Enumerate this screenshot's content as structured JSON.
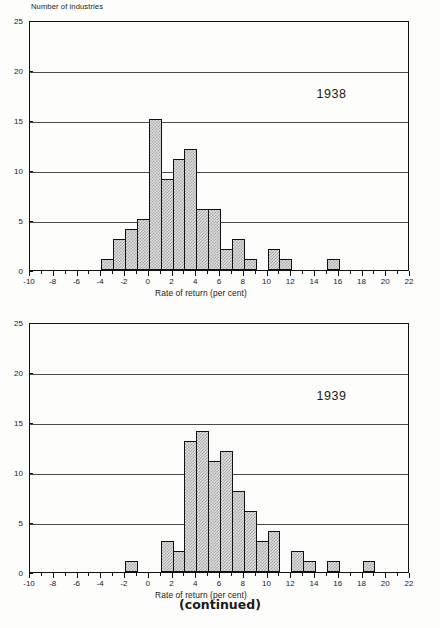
{
  "page": {
    "footer_note": "(continued)"
  },
  "chart_data": [
    {
      "id": "chart-1938",
      "type": "bar",
      "title": "1938",
      "subtitle": "",
      "xlabel": "Rate of return (per cent)",
      "ylabel": "Number of industries",
      "xlim": [
        -10,
        22
      ],
      "ylim": [
        0,
        25
      ],
      "grid": "horizontal",
      "legend": "none",
      "annotation": "1938",
      "x_major_ticks": [
        -10,
        -8,
        -6,
        -4,
        -2,
        0,
        2,
        4,
        6,
        8,
        10,
        12,
        14,
        16,
        18,
        20,
        22
      ],
      "x_minor_ticks": [
        -9,
        -7,
        -5,
        -3,
        -1,
        1,
        3,
        5,
        7,
        9,
        11,
        13,
        15,
        17,
        19,
        21
      ],
      "x_tick_labels": [
        "-10",
        "-8",
        "-6",
        "-4",
        "-2",
        "0",
        "2",
        "4",
        "6",
        "8",
        "10",
        "12",
        "14",
        "16",
        "18",
        "20",
        "22"
      ],
      "y_ticks": [
        0,
        5,
        10,
        15,
        20,
        25
      ],
      "y_tick_labels": [
        "0",
        "5",
        "10",
        "15",
        "20",
        "25"
      ],
      "bin_width": 1,
      "bins": [
        {
          "start": -4,
          "end": -3,
          "value": 1
        },
        {
          "start": -3,
          "end": -2,
          "value": 3
        },
        {
          "start": -2,
          "end": -1,
          "value": 4
        },
        {
          "start": -1,
          "end": 0,
          "value": 5
        },
        {
          "start": 0,
          "end": 1,
          "value": 15
        },
        {
          "start": 1,
          "end": 2,
          "value": 9
        },
        {
          "start": 2,
          "end": 3,
          "value": 11
        },
        {
          "start": 3,
          "end": 4,
          "value": 12
        },
        {
          "start": 4,
          "end": 5,
          "value": 6
        },
        {
          "start": 5,
          "end": 6,
          "value": 6
        },
        {
          "start": 6,
          "end": 7,
          "value": 2
        },
        {
          "start": 7,
          "end": 8,
          "value": 3
        },
        {
          "start": 8,
          "end": 9,
          "value": 1
        },
        {
          "start": 10,
          "end": 11,
          "value": 2
        },
        {
          "start": 11,
          "end": 12,
          "value": 1
        },
        {
          "start": 15,
          "end": 16,
          "value": 1
        }
      ]
    },
    {
      "id": "chart-1939",
      "type": "bar",
      "title": "1939",
      "subtitle": "",
      "xlabel": "Rate of return (per cent)",
      "ylabel": "",
      "xlim": [
        -10,
        22
      ],
      "ylim": [
        0,
        25
      ],
      "grid": "horizontal",
      "legend": "none",
      "annotation": "1939",
      "x_major_ticks": [
        -10,
        -8,
        -6,
        -4,
        -2,
        0,
        2,
        4,
        6,
        8,
        10,
        12,
        14,
        16,
        18,
        20,
        22
      ],
      "x_minor_ticks": [
        -9,
        -7,
        -5,
        -3,
        -1,
        1,
        3,
        5,
        7,
        9,
        11,
        13,
        15,
        17,
        19,
        21
      ],
      "x_tick_labels": [
        "-10",
        "-8",
        "-6",
        "-4",
        "-2",
        "0",
        "2",
        "4",
        "6",
        "8",
        "10",
        "12",
        "14",
        "16",
        "18",
        "20",
        "22"
      ],
      "y_ticks": [
        0,
        5,
        10,
        15,
        20,
        25
      ],
      "y_tick_labels": [
        "0",
        "5",
        "10",
        "15",
        "20",
        "25"
      ],
      "bin_width": 1,
      "bins": [
        {
          "start": -2,
          "end": -1,
          "value": 1
        },
        {
          "start": 1,
          "end": 2,
          "value": 3
        },
        {
          "start": 2,
          "end": 3,
          "value": 2
        },
        {
          "start": 3,
          "end": 4,
          "value": 13
        },
        {
          "start": 4,
          "end": 5,
          "value": 14
        },
        {
          "start": 5,
          "end": 6,
          "value": 11
        },
        {
          "start": 6,
          "end": 7,
          "value": 12
        },
        {
          "start": 7,
          "end": 8,
          "value": 8
        },
        {
          "start": 8,
          "end": 9,
          "value": 6
        },
        {
          "start": 9,
          "end": 10,
          "value": 3
        },
        {
          "start": 10,
          "end": 11,
          "value": 4
        },
        {
          "start": 12,
          "end": 13,
          "value": 2
        },
        {
          "start": 13,
          "end": 14,
          "value": 1
        },
        {
          "start": 15,
          "end": 16,
          "value": 1
        },
        {
          "start": 18,
          "end": 19,
          "value": 1
        }
      ]
    }
  ]
}
